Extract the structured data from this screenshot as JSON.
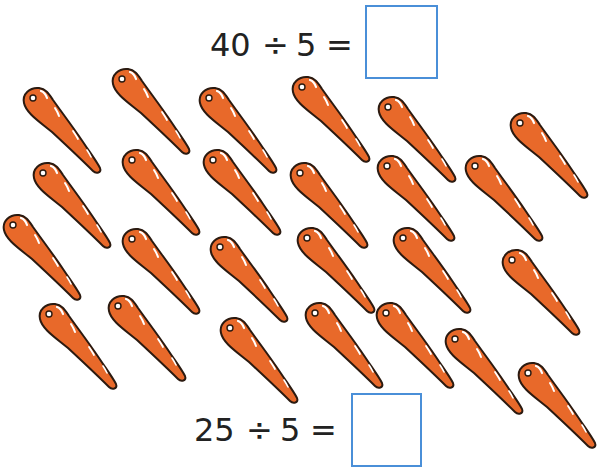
{
  "problems": [
    {
      "dividend": "40",
      "operator": "÷",
      "divisor": "5",
      "equals": "=",
      "answer": ""
    },
    {
      "dividend": "25",
      "operator": "÷",
      "divisor": "5",
      "equals": "=",
      "answer": ""
    }
  ],
  "colors": {
    "carrot_fill": "#e8692a",
    "carrot_outline": "#2b1a10",
    "answer_box_border": "#4a8fd8",
    "text": "#222222"
  },
  "carrot_count": 25,
  "carrots": [
    {
      "x": 33,
      "y": 98
    },
    {
      "x": 122,
      "y": 79
    },
    {
      "x": 209,
      "y": 98
    },
    {
      "x": 302,
      "y": 87
    },
    {
      "x": 388,
      "y": 107
    },
    {
      "x": 520,
      "y": 123
    },
    {
      "x": 43,
      "y": 173
    },
    {
      "x": 132,
      "y": 160
    },
    {
      "x": 213,
      "y": 160
    },
    {
      "x": 300,
      "y": 173
    },
    {
      "x": 387,
      "y": 166
    },
    {
      "x": 475,
      "y": 166
    },
    {
      "x": 13,
      "y": 225
    },
    {
      "x": 132,
      "y": 239
    },
    {
      "x": 220,
      "y": 247
    },
    {
      "x": 307,
      "y": 238
    },
    {
      "x": 403,
      "y": 238
    },
    {
      "x": 512,
      "y": 260
    },
    {
      "x": 49,
      "y": 314
    },
    {
      "x": 118,
      "y": 306
    },
    {
      "x": 230,
      "y": 328
    },
    {
      "x": 315,
      "y": 313
    },
    {
      "x": 386,
      "y": 313
    },
    {
      "x": 455,
      "y": 339
    },
    {
      "x": 528,
      "y": 373
    }
  ]
}
